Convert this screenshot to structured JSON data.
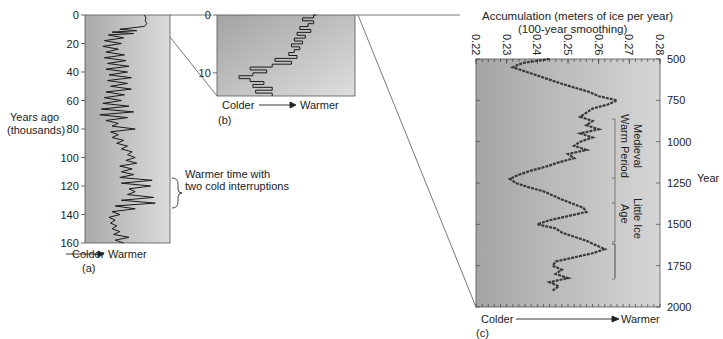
{
  "chart_data": [
    {
      "id": "a",
      "type": "line",
      "panel_label": "(a)",
      "title": "",
      "ylabel": "Years ago\n(thousands)",
      "ylabel_line1": "Years ago",
      "ylabel_line2": "(thousands)",
      "xlabel_left": "Colder",
      "xlabel_right": "Warmer",
      "y_ticks": [
        "0",
        "20",
        "40",
        "60",
        "80",
        "100",
        "120",
        "140",
        "160"
      ],
      "ylim": [
        0,
        160
      ],
      "y_inverted": true,
      "annotation": "Warmer time with two cold interruptions",
      "annotation_line1": "Warmer time with",
      "annotation_line2": "two cold interruptions",
      "annotation_range": [
        114,
        133
      ],
      "series": [
        {
          "name": "relative temperature (0=colder, 1=warmer)",
          "y": [
            0,
            2,
            4,
            6,
            8,
            10,
            11,
            12,
            13,
            14,
            16,
            18,
            20,
            22,
            24,
            26,
            28,
            30,
            32,
            34,
            36,
            38,
            40,
            42,
            44,
            46,
            48,
            50,
            52,
            54,
            56,
            58,
            60,
            62,
            64,
            66,
            68,
            70,
            72,
            74,
            76,
            78,
            80,
            82,
            84,
            86,
            88,
            90,
            92,
            94,
            96,
            98,
            100,
            102,
            104,
            106,
            108,
            110,
            112,
            114,
            116,
            118,
            120,
            122,
            124,
            126,
            128,
            130,
            132,
            134,
            136,
            138,
            140,
            142,
            144,
            146,
            148,
            150,
            152,
            154,
            156,
            158,
            160
          ],
          "x": [
            0.72,
            0.74,
            0.73,
            0.75,
            0.72,
            0.4,
            0.62,
            0.3,
            0.58,
            0.25,
            0.45,
            0.2,
            0.42,
            0.18,
            0.38,
            0.22,
            0.46,
            0.2,
            0.48,
            0.24,
            0.52,
            0.22,
            0.5,
            0.26,
            0.55,
            0.24,
            0.5,
            0.28,
            0.55,
            0.22,
            0.46,
            0.2,
            0.42,
            0.18,
            0.52,
            0.16,
            0.58,
            0.14,
            0.5,
            0.22,
            0.38,
            0.3,
            0.6,
            0.28,
            0.38,
            0.3,
            0.45,
            0.36,
            0.5,
            0.42,
            0.56,
            0.5,
            0.6,
            0.48,
            0.62,
            0.4,
            0.56,
            0.42,
            0.58,
            0.4,
            0.82,
            0.42,
            0.8,
            0.52,
            0.6,
            0.5,
            0.84,
            0.42,
            0.86,
            0.34,
            0.6,
            0.3,
            0.4,
            0.26,
            0.34,
            0.28,
            0.36,
            0.3,
            0.4,
            0.32,
            0.52,
            0.34,
            0.45
          ]
        }
      ]
    },
    {
      "id": "b",
      "type": "line",
      "panel_label": "(b)",
      "xlabel_left": "Colder",
      "xlabel_right": "Warmer",
      "y_ticks": [
        "0",
        "10"
      ],
      "ylim": [
        0,
        14
      ],
      "y_inverted": true,
      "series": [
        {
          "name": "relative temperature (0=colder, 1=warmer)",
          "y": [
            0,
            0.5,
            1,
            1.5,
            2,
            2.5,
            3,
            3.5,
            4,
            4.5,
            5,
            5.5,
            6,
            6.5,
            7,
            7.5,
            8,
            8.5,
            9,
            9.5,
            10,
            10.5,
            11,
            11.5,
            12,
            12.5,
            13,
            13.5,
            14
          ],
          "x": [
            0.72,
            0.7,
            0.62,
            0.7,
            0.66,
            0.6,
            0.68,
            0.58,
            0.64,
            0.56,
            0.62,
            0.54,
            0.6,
            0.56,
            0.52,
            0.58,
            0.42,
            0.54,
            0.4,
            0.24,
            0.36,
            0.26,
            0.16,
            0.24,
            0.34,
            0.26,
            0.4,
            0.28,
            0.4
          ]
        }
      ]
    },
    {
      "id": "c",
      "type": "line",
      "panel_label": "(c)",
      "title": "Accumulation (meters of ice per year)",
      "subtitle": "(100-year smoothing)",
      "xlabel_left": "Colder",
      "xlabel_right": "Warmer",
      "x_ticks": [
        "0.22",
        "0.23",
        "0.24",
        "0.25",
        "0.26",
        "0.27",
        "0.28"
      ],
      "xlim": [
        0.22,
        0.28
      ],
      "y_ticks": [
        "500",
        "750",
        "1000",
        "1250",
        "1500",
        "1750",
        "2000"
      ],
      "ylim": [
        500,
        2000
      ],
      "y_inverted": true,
      "ylabel": "Year",
      "annotations": [
        {
          "text": "Medieval Warm Period",
          "line1": "Medieval",
          "line2": "Warm Period",
          "range": [
            750,
            1120
          ]
        },
        {
          "text": "Little Ice Age",
          "line1": "Little Ice",
          "line2": "Age",
          "range": [
            1120,
            1780
          ]
        }
      ],
      "series": [
        {
          "name": "Accumulation (m ice/yr)",
          "year": [
            500,
            525,
            550,
            575,
            600,
            650,
            700,
            725,
            750,
            775,
            800,
            825,
            850,
            875,
            900,
            925,
            950,
            975,
            1000,
            1025,
            1050,
            1075,
            1100,
            1125,
            1150,
            1175,
            1200,
            1225,
            1250,
            1275,
            1300,
            1350,
            1400,
            1425,
            1450,
            1475,
            1500,
            1525,
            1550,
            1600,
            1650,
            1675,
            1700,
            1725,
            1750,
            1775,
            1800,
            1825,
            1850,
            1875,
            1900
          ],
          "values": [
            0.244,
            0.235,
            0.232,
            0.236,
            0.24,
            0.248,
            0.257,
            0.26,
            0.266,
            0.263,
            0.258,
            0.256,
            0.254,
            0.258,
            0.256,
            0.26,
            0.254,
            0.258,
            0.254,
            0.252,
            0.256,
            0.25,
            0.252,
            0.247,
            0.243,
            0.238,
            0.234,
            0.231,
            0.233,
            0.237,
            0.242,
            0.248,
            0.255,
            0.256,
            0.25,
            0.244,
            0.24,
            0.246,
            0.248,
            0.256,
            0.262,
            0.258,
            0.252,
            0.246,
            0.245,
            0.248,
            0.246,
            0.25,
            0.244,
            0.247,
            0.245
          ]
        }
      ]
    }
  ],
  "figure": {
    "callout_year_label": "Year"
  }
}
